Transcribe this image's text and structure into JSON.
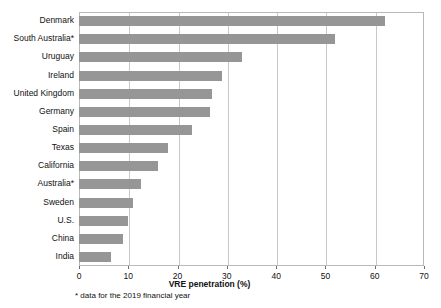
{
  "figure": {
    "footnote": "* data for the 2019 financial year"
  },
  "chart_data": {
    "type": "bar",
    "orientation": "horizontal",
    "title": "",
    "xlabel": "VRE penetration (%)",
    "ylabel": "",
    "xlim": [
      0,
      70
    ],
    "xticks": [
      0,
      10,
      20,
      30,
      40,
      50,
      60,
      70
    ],
    "xtick_labels": [
      "0",
      "10",
      "20",
      "30",
      "40",
      "50",
      "60",
      "70"
    ],
    "grid": "vertical",
    "legend": "none",
    "bar_color": "#969696",
    "categories": [
      "Denmark",
      "South Australia*",
      "Uruguay",
      "Ireland",
      "United Kingdom",
      "Germany",
      "Spain",
      "Texas",
      "California",
      "Australia*",
      "Sweden",
      "U.S.",
      "China",
      "India"
    ],
    "values": [
      62,
      52,
      33,
      29,
      27,
      26.5,
      23,
      18,
      16,
      12.5,
      11,
      10,
      9,
      6.5
    ],
    "annotations": [
      "* data for the 2019 financial year"
    ]
  }
}
